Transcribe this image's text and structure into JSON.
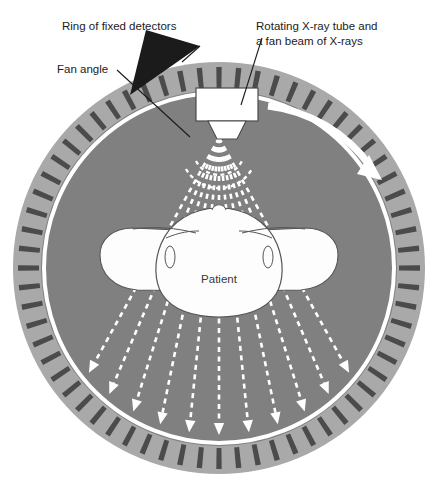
{
  "figure": {
    "background": "#ffffff"
  },
  "labels": {
    "detectors": {
      "line1": "Ring of fixed detectors",
      "x": 62,
      "y": 26
    },
    "fan_angle": {
      "line1": "Fan angle",
      "x": 57,
      "y": 68
    },
    "tube": {
      "line1": "Rotating X-ray tube and",
      "line2": "a fan beam of X-rays",
      "x": 256,
      "y": 26
    },
    "patient": {
      "line1": "Patient",
      "x": 219,
      "y": 283
    }
  },
  "colors": {
    "detector_band": "#a9a9a9",
    "detector_bar": "#4b4b4b",
    "bore_fill": "#808080",
    "ring_line": "#ffffff",
    "ray": "#ffffff",
    "patient_fill": "#fdfdfd",
    "patient_stroke": "#555555",
    "leader": "#1b1b1b",
    "text": "#1b1b1b",
    "tube_fill": "#ffffff",
    "tube_stroke": "#4a4a4a"
  },
  "geometry": {
    "center_x": 219,
    "center_y": 268,
    "outer_radius": 206,
    "band_inner_radius": 178,
    "bore_radius": 172,
    "detector_count": 64,
    "source_x": 219,
    "source_y": 138,
    "ray_count": 11,
    "fan_half_angle_deg": 29
  },
  "elements": {
    "xray_tube": "rotating-x-ray-tube",
    "collimator": "fan-beam-collimator",
    "rotation_arrow": "clockwise-rotation-arrow",
    "fan_arcs": 2
  }
}
